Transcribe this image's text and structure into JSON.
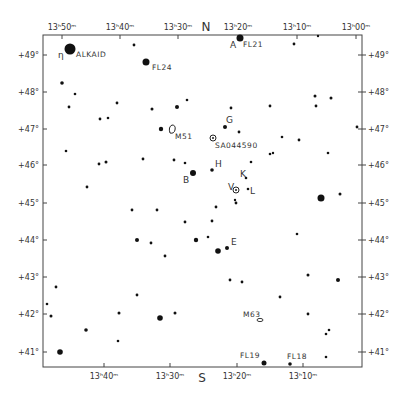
{
  "chart_data": {
    "type": "scatter",
    "frame": {
      "left": 43,
      "right": 362,
      "top": 35,
      "bottom": 367
    },
    "compass": {
      "top": "N",
      "bottom": "S"
    },
    "x_axis": {
      "label": "Right Ascension",
      "top_ticks": [
        {
          "label": "13ʰ50ᵐ",
          "x": 62
        },
        {
          "label": "13ʰ40ᵐ",
          "x": 120
        },
        {
          "label": "13ʰ30ᵐ",
          "x": 178
        },
        {
          "label": "13ʰ20ᵐ",
          "x": 238
        },
        {
          "label": "13ʰ10ᵐ",
          "x": 297
        },
        {
          "label": "13ʰ00ᵐ",
          "x": 356
        }
      ],
      "bottom_ticks": [
        {
          "label": "13ʰ40ᵐ",
          "x": 104
        },
        {
          "label": "13ʰ30ᵐ",
          "x": 170
        },
        {
          "label": "13ʰ20ᵐ",
          "x": 237
        },
        {
          "label": "13ʰ10ᵐ",
          "x": 303
        }
      ]
    },
    "y_axis": {
      "label": "Declination",
      "ticks": [
        {
          "label": "+49°",
          "y": 55
        },
        {
          "label": "+48°",
          "y": 92
        },
        {
          "label": "+47°",
          "y": 129
        },
        {
          "label": "+46°",
          "y": 165
        },
        {
          "label": "+45°",
          "y": 203
        },
        {
          "label": "+44°",
          "y": 240
        },
        {
          "label": "+43°",
          "y": 277
        },
        {
          "label": "+42°",
          "y": 314
        },
        {
          "label": "+41°",
          "y": 352
        }
      ]
    },
    "stars": [
      {
        "x": 70,
        "y": 49,
        "r": 5.5
      },
      {
        "x": 146,
        "y": 62,
        "r": 3.5
      },
      {
        "x": 134,
        "y": 45,
        "r": 1.4
      },
      {
        "x": 240,
        "y": 38,
        "r": 3.5
      },
      {
        "x": 294,
        "y": 44,
        "r": 1.4
      },
      {
        "x": 318,
        "y": 36,
        "r": 1.2
      },
      {
        "x": 62,
        "y": 83,
        "r": 1.8
      },
      {
        "x": 75,
        "y": 94,
        "r": 1.3
      },
      {
        "x": 69,
        "y": 107,
        "r": 1.4
      },
      {
        "x": 117,
        "y": 103,
        "r": 1.4
      },
      {
        "x": 100,
        "y": 119,
        "r": 1.4
      },
      {
        "x": 108,
        "y": 118,
        "r": 1.3
      },
      {
        "x": 152,
        "y": 109,
        "r": 1.5
      },
      {
        "x": 177,
        "y": 107,
        "r": 2.0
      },
      {
        "x": 187,
        "y": 100,
        "r": 1.3
      },
      {
        "x": 161,
        "y": 129,
        "r": 2.2
      },
      {
        "x": 66,
        "y": 151,
        "r": 1.3
      },
      {
        "x": 99,
        "y": 164,
        "r": 1.4
      },
      {
        "x": 106,
        "y": 162,
        "r": 1.5
      },
      {
        "x": 143,
        "y": 159,
        "r": 1.4
      },
      {
        "x": 174,
        "y": 160,
        "r": 1.4
      },
      {
        "x": 231,
        "y": 108,
        "r": 1.4
      },
      {
        "x": 270,
        "y": 106,
        "r": 1.4
      },
      {
        "x": 315,
        "y": 96,
        "r": 1.5
      },
      {
        "x": 331,
        "y": 98,
        "r": 1.5
      },
      {
        "x": 316,
        "y": 106,
        "r": 1.4
      },
      {
        "x": 357,
        "y": 127,
        "r": 1.4
      },
      {
        "x": 225,
        "y": 127,
        "r": 2.0
      },
      {
        "x": 239,
        "y": 132,
        "r": 1.4
      },
      {
        "x": 282,
        "y": 137,
        "r": 1.3
      },
      {
        "x": 299,
        "y": 140,
        "r": 1.4
      },
      {
        "x": 270,
        "y": 154,
        "r": 1.3
      },
      {
        "x": 273,
        "y": 153,
        "r": 1.2
      },
      {
        "x": 328,
        "y": 153,
        "r": 1.3
      },
      {
        "x": 251,
        "y": 162,
        "r": 1.3
      },
      {
        "x": 193,
        "y": 173,
        "r": 3.0
      },
      {
        "x": 212,
        "y": 170,
        "r": 1.8
      },
      {
        "x": 185,
        "y": 163,
        "r": 1.3
      },
      {
        "x": 246,
        "y": 178,
        "r": 1.3
      },
      {
        "x": 248,
        "y": 189,
        "r": 1.3
      },
      {
        "x": 236,
        "y": 203,
        "r": 1.4
      },
      {
        "x": 321,
        "y": 198,
        "r": 3.5
      },
      {
        "x": 340,
        "y": 194,
        "r": 1.5
      },
      {
        "x": 87,
        "y": 187,
        "r": 1.4
      },
      {
        "x": 132,
        "y": 210,
        "r": 1.4
      },
      {
        "x": 157,
        "y": 210,
        "r": 1.4
      },
      {
        "x": 185,
        "y": 222,
        "r": 1.4
      },
      {
        "x": 212,
        "y": 221,
        "r": 1.4
      },
      {
        "x": 216,
        "y": 207,
        "r": 1.4
      },
      {
        "x": 235,
        "y": 200,
        "r": 1.2
      },
      {
        "x": 196,
        "y": 240,
        "r": 2.2
      },
      {
        "x": 208,
        "y": 237,
        "r": 1.3
      },
      {
        "x": 218,
        "y": 251,
        "r": 2.8
      },
      {
        "x": 227,
        "y": 248,
        "r": 2.0
      },
      {
        "x": 297,
        "y": 234,
        "r": 1.3
      },
      {
        "x": 137,
        "y": 240,
        "r": 2.0
      },
      {
        "x": 151,
        "y": 243,
        "r": 1.4
      },
      {
        "x": 165,
        "y": 256,
        "r": 1.4
      },
      {
        "x": 56,
        "y": 287,
        "r": 1.4
      },
      {
        "x": 137,
        "y": 295,
        "r": 1.4
      },
      {
        "x": 47,
        "y": 304,
        "r": 1.3
      },
      {
        "x": 51,
        "y": 316,
        "r": 1.5
      },
      {
        "x": 119,
        "y": 313,
        "r": 1.5
      },
      {
        "x": 160,
        "y": 318,
        "r": 2.8
      },
      {
        "x": 175,
        "y": 313,
        "r": 1.5
      },
      {
        "x": 230,
        "y": 280,
        "r": 1.4
      },
      {
        "x": 242,
        "y": 282,
        "r": 1.4
      },
      {
        "x": 280,
        "y": 297,
        "r": 1.4
      },
      {
        "x": 308,
        "y": 275,
        "r": 1.5
      },
      {
        "x": 338,
        "y": 280,
        "r": 2.0
      },
      {
        "x": 86,
        "y": 330,
        "r": 1.8
      },
      {
        "x": 118,
        "y": 341,
        "r": 1.3
      },
      {
        "x": 308,
        "y": 314,
        "r": 1.4
      },
      {
        "x": 326,
        "y": 334,
        "r": 1.3
      },
      {
        "x": 329,
        "y": 330,
        "r": 1.3
      },
      {
        "x": 60,
        "y": 352,
        "r": 2.8
      },
      {
        "x": 326,
        "y": 357,
        "r": 1.3
      },
      {
        "x": 264,
        "y": 363,
        "r": 2.5
      },
      {
        "x": 290,
        "y": 364,
        "r": 1.8
      }
    ],
    "deep_sky": [
      {
        "name": "M51",
        "x": 172,
        "y": 130,
        "shape": "galaxy"
      },
      {
        "name": "SA044590",
        "x": 213,
        "y": 138,
        "shape": "circle-dot"
      },
      {
        "name": "V",
        "x": 236,
        "y": 190,
        "shape": "circle-dot"
      },
      {
        "name": "M63",
        "x": 260,
        "y": 320,
        "shape": "oval"
      }
    ],
    "annotations": [
      {
        "text": "η",
        "x": 58,
        "y": 58
      },
      {
        "text": "ALKAID",
        "x": 76,
        "y": 57
      },
      {
        "text": "FL24",
        "x": 152,
        "y": 70
      },
      {
        "text": "A",
        "x": 230,
        "y": 48
      },
      {
        "text": "FL21",
        "x": 243,
        "y": 47
      },
      {
        "text": "M51",
        "x": 175,
        "y": 139
      },
      {
        "text": "SA044590",
        "x": 215,
        "y": 148
      },
      {
        "text": "G",
        "x": 226,
        "y": 123
      },
      {
        "text": "H",
        "x": 215,
        "y": 167
      },
      {
        "text": "B",
        "x": 183,
        "y": 183
      },
      {
        "text": "K",
        "x": 240,
        "y": 177
      },
      {
        "text": "V",
        "x": 228,
        "y": 190
      },
      {
        "text": "L",
        "x": 250,
        "y": 194
      },
      {
        "text": "E",
        "x": 231,
        "y": 245
      },
      {
        "text": "M63",
        "x": 243,
        "y": 317
      },
      {
        "text": "FL19",
        "x": 240,
        "y": 358
      },
      {
        "text": "FL18",
        "x": 287,
        "y": 359
      }
    ],
    "grid": false,
    "legend": null
  }
}
